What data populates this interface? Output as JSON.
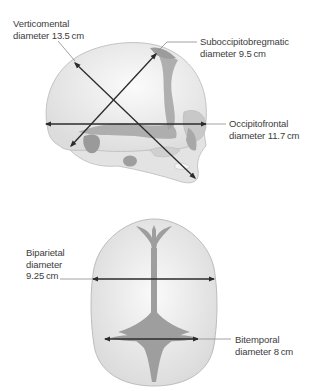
{
  "figure": {
    "side_view": {
      "labels": {
        "verticomental": {
          "line1": "Verticomental",
          "line2": "diameter 13.5 cm"
        },
        "suboccipitobregmatic": {
          "line1": "Suboccipitobregmatic",
          "line2": "diameter 9.5 cm"
        },
        "occipitofrontal": {
          "line1": "Occipitofrontal",
          "line2": "diameter 11.7 cm"
        }
      }
    },
    "top_view": {
      "labels": {
        "biparietal": {
          "line1": "Biparietal",
          "line2": "diameter",
          "line3": "9.25 cm"
        },
        "bitemporal": {
          "line1": "Bitemporal",
          "line2": "diameter 8 cm"
        }
      }
    },
    "colors": {
      "bone": "#e6e6e6",
      "bone_outline": "#c4c4c4",
      "suture": "#9a9a9a",
      "arrow": "#2b2b2b",
      "leader": "#8a8a8a"
    }
  }
}
